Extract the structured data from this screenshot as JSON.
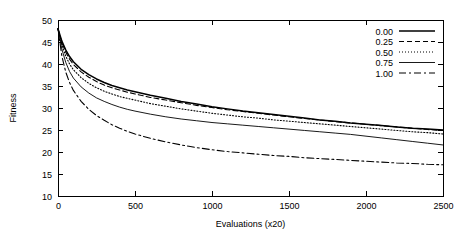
{
  "chart_data": {
    "type": "line",
    "title": "",
    "xlabel": "Evaluations (x20)",
    "ylabel": "Fitness",
    "xlim": [
      0,
      2500
    ],
    "ylim": [
      10,
      50
    ],
    "xticks": [
      0,
      500,
      1000,
      1500,
      2000,
      2500
    ],
    "yticks": [
      10,
      15,
      20,
      25,
      30,
      35,
      40,
      45,
      50
    ],
    "xticklabels": [
      "0",
      "500",
      "1000",
      "1500",
      "2000",
      "2500"
    ],
    "yticklabels": [
      "10",
      "15",
      "20",
      "25",
      "30",
      "35",
      "40",
      "45",
      "50"
    ],
    "grid": false,
    "legend_position": "upper right",
    "legend_title": "",
    "x": [
      0,
      25,
      50,
      75,
      100,
      150,
      200,
      250,
      300,
      350,
      400,
      450,
      500,
      600,
      700,
      800,
      900,
      1000,
      1100,
      1200,
      1300,
      1400,
      1500,
      1600,
      1700,
      1800,
      1900,
      2000,
      2100,
      2200,
      2300,
      2400,
      2500
    ],
    "series": [
      {
        "name": "0.00",
        "style": "solid",
        "values": [
          48.0,
          45.2,
          43.2,
          41.7,
          40.5,
          38.8,
          37.6,
          36.6,
          35.8,
          35.1,
          34.6,
          34.1,
          33.7,
          32.9,
          32.2,
          31.5,
          30.9,
          30.3,
          29.8,
          29.3,
          28.9,
          28.5,
          28.1,
          27.7,
          27.3,
          27.0,
          26.6,
          26.3,
          26.0,
          25.7,
          25.4,
          25.2,
          25.0
        ]
      },
      {
        "name": "0.25",
        "style": "dashed",
        "values": [
          48.0,
          44.9,
          42.7,
          41.1,
          39.9,
          38.2,
          37.0,
          36.0,
          35.2,
          34.6,
          34.1,
          33.6,
          33.2,
          32.4,
          31.8,
          31.2,
          30.6,
          30.1,
          29.6,
          29.2,
          28.8,
          28.4,
          28.0,
          27.6,
          27.3,
          26.9,
          26.6,
          26.3,
          26.0,
          25.7,
          25.4,
          25.1,
          24.9
        ]
      },
      {
        "name": "0.50",
        "style": "dotted",
        "values": [
          48.0,
          44.3,
          41.8,
          40.0,
          38.7,
          36.9,
          35.6,
          34.6,
          33.8,
          33.2,
          32.6,
          32.2,
          31.8,
          31.0,
          30.4,
          29.8,
          29.3,
          28.8,
          28.4,
          28.0,
          27.7,
          27.3,
          27.0,
          26.7,
          26.4,
          26.1,
          25.8,
          25.5,
          25.2,
          24.9,
          24.6,
          24.4,
          24.1
        ]
      },
      {
        "name": "0.75",
        "style": "thin-solid",
        "values": [
          48.0,
          43.4,
          40.4,
          38.3,
          36.8,
          34.8,
          33.4,
          32.3,
          31.5,
          30.8,
          30.2,
          29.7,
          29.3,
          28.6,
          28.0,
          27.5,
          27.1,
          26.7,
          26.4,
          26.1,
          25.8,
          25.5,
          25.2,
          24.9,
          24.6,
          24.3,
          24.0,
          23.6,
          23.2,
          22.8,
          22.4,
          22.0,
          21.6
        ]
      },
      {
        "name": "1.00",
        "style": "dash-dot",
        "values": [
          48.0,
          41.8,
          38.2,
          35.8,
          34.0,
          31.5,
          29.7,
          28.3,
          27.2,
          26.2,
          25.4,
          24.7,
          24.1,
          23.1,
          22.3,
          21.6,
          21.0,
          20.5,
          20.1,
          19.8,
          19.5,
          19.2,
          19.0,
          18.7,
          18.5,
          18.3,
          18.1,
          17.9,
          17.7,
          17.5,
          17.4,
          17.2,
          17.1
        ]
      }
    ]
  },
  "plot": {
    "frame_left": 58,
    "frame_right": 443,
    "frame_top": 20,
    "frame_bottom": 196
  }
}
